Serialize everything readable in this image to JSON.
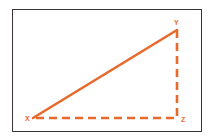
{
  "diagram": {
    "type": "right-triangle",
    "colors": {
      "stroke": "#e8692c",
      "frame": "#3a3533",
      "background": "#ffffff"
    },
    "vertices": {
      "X": {
        "label": "X",
        "x": 33,
        "y": 118
      },
      "Y": {
        "label": "Y",
        "x": 177,
        "y": 30
      },
      "Z": {
        "label": "Z",
        "x": 177,
        "y": 118
      }
    },
    "edges": [
      {
        "from": "X",
        "to": "Y",
        "style": "solid"
      },
      {
        "from": "X",
        "to": "Z",
        "style": "dashed"
      },
      {
        "from": "Y",
        "to": "Z",
        "style": "dashed"
      }
    ]
  }
}
